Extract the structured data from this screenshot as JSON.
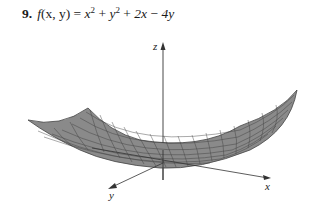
{
  "problem": {
    "number": "9.",
    "func": "f",
    "args": "(x, y)",
    "equals": "=",
    "t1": "x",
    "t1_exp": "2",
    "plus1": "+",
    "t2": "y",
    "t2_exp": "2",
    "plus2": "+",
    "t3": "2x",
    "minus": "−",
    "t4": "4y"
  },
  "figure": {
    "axes": {
      "z_label": "z",
      "y_label": "y",
      "x_label": "x"
    },
    "surface_color": "#8a8a8a",
    "grid_color": "#3a3a3a"
  }
}
